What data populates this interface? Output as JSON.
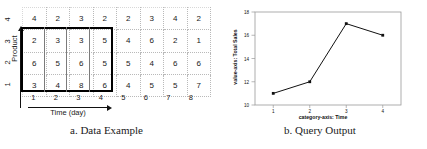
{
  "panel_a": {
    "caption": "a. Data Example",
    "y_axis_label": "Product",
    "x_axis_label": "Time (day)",
    "y_ticks": [
      "1",
      "2",
      "3",
      "4"
    ],
    "x_ticks": [
      "1",
      "2",
      "3",
      "4",
      "5",
      "6",
      "7",
      "8"
    ],
    "grid_rows": [
      {
        "product": "4",
        "values": [
          "4",
          "2",
          "3",
          "2",
          "2",
          "3",
          "4",
          "2"
        ]
      },
      {
        "product": "3",
        "values": [
          "2",
          "3",
          "3",
          "5",
          "4",
          "6",
          "2",
          "1"
        ]
      },
      {
        "product": "2",
        "values": [
          "6",
          "5",
          "6",
          "5",
          "5",
          "4",
          "6",
          "6"
        ]
      },
      {
        "product": "1",
        "values": [
          "3",
          "4",
          "8",
          "6",
          "4",
          "5",
          "5",
          "7"
        ]
      }
    ],
    "selection": {
      "products": [
        "1",
        "2",
        "3"
      ],
      "times": [
        "1",
        "2",
        "3",
        "4"
      ]
    }
  },
  "panel_b": {
    "caption": "b. Query Output"
  },
  "chart_data": {
    "type": "line",
    "title": "",
    "xlabel": "category-axis: Time",
    "ylabel": "value-axis: Total Sales",
    "categories": [
      "1",
      "2",
      "3",
      "4"
    ],
    "values": [
      11,
      12,
      17,
      16
    ],
    "ytick_labels": [
      "10",
      "12",
      "14",
      "16",
      "18"
    ],
    "ytick_values": [
      10,
      12,
      14,
      16,
      18
    ],
    "ylim": [
      10,
      18
    ],
    "grid": false,
    "legend": "none",
    "marker": "square",
    "line_color": "#111111",
    "marker_color": "#111111"
  }
}
